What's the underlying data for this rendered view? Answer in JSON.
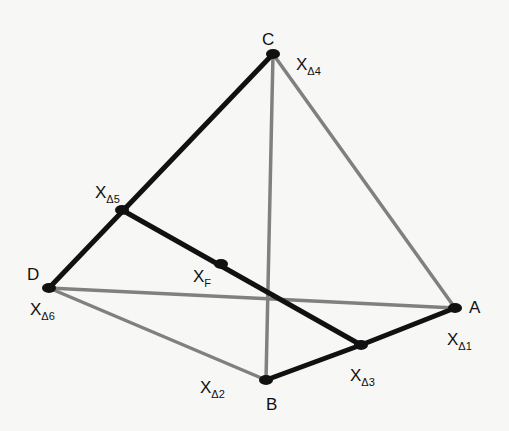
{
  "diagram": {
    "colors": {
      "thick": "#111111",
      "thin": "#808080",
      "background": "#f7f7f5"
    },
    "vertices": {
      "C": {
        "label": "C",
        "x": 273,
        "y": 54
      },
      "D": {
        "label": "D",
        "x": 49,
        "y": 288
      },
      "A": {
        "label": "A",
        "x": 455,
        "y": 308
      },
      "B": {
        "label": "B",
        "x": 266,
        "y": 380
      }
    },
    "points": {
      "X_d5": {
        "x": 122,
        "y": 210
      },
      "X_F": {
        "x": 221,
        "y": 264
      },
      "X_d3": {
        "x": 361,
        "y": 345
      }
    },
    "labels": {
      "C": "C",
      "D": "D",
      "A": "A",
      "B": "B",
      "x_main": "X",
      "xd4_sub": "Δ4",
      "xd5_sub": "Δ5",
      "xd6_sub": "Δ6",
      "xf_sub": "F",
      "xd1_sub": "Δ1",
      "xd3_sub": "Δ3",
      "xd2_sub": "Δ2",
      "xd1_main": "X̄"
    },
    "thick_edges": [
      [
        "C",
        "X_d5"
      ],
      [
        "X_d5",
        "D"
      ],
      [
        "X_d5",
        "X_F"
      ],
      [
        "X_F",
        "X_d3"
      ],
      [
        "B",
        "X_d3"
      ],
      [
        "X_d3",
        "A"
      ]
    ],
    "thin_edges": [
      [
        "C",
        "B"
      ],
      [
        "C",
        "A"
      ],
      [
        "D",
        "A"
      ],
      [
        "D",
        "B"
      ]
    ]
  }
}
